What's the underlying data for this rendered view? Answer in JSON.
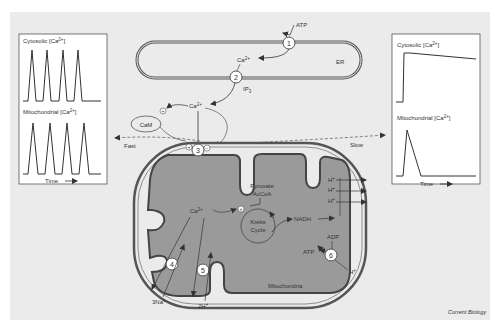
{
  "figure": {
    "credit": "Current Biology",
    "background_color": "#ebebeb",
    "matrix_color": "#9a9a9a",
    "membrane_color": "#555555"
  },
  "left_panel": {
    "top_label": "Cytosolic [Ca",
    "top_sup": "2+",
    "top_close": "]",
    "bottom_label": "Mitochondrial [Ca",
    "bottom_sup": "2+",
    "bottom_close": "]",
    "time_label": "Time",
    "cytosolic_trace": {
      "type": "oscillation",
      "spikes": 4
    },
    "mitochondrial_trace": {
      "type": "oscillation",
      "spikes": 4
    }
  },
  "right_panel": {
    "top_label": "Cytosolic [Ca",
    "top_sup": "2+",
    "top_close": "]",
    "bottom_label": "Mitochondrial [Ca",
    "bottom_sup": "2+",
    "bottom_close": "]",
    "time_label": "Time",
    "cytosolic_trace": {
      "type": "sustained-plateau"
    },
    "mitochondrial_trace": {
      "type": "single-transient"
    }
  },
  "er": {
    "label": "ER",
    "atp": "ATP",
    "ca": "Ca",
    "ca_sup": "2+",
    "ip3": "IP",
    "ip3_sub": "3"
  },
  "cytosol": {
    "ca": "Ca",
    "ca_sup": "2+",
    "cam": "CaM",
    "fast": "Fast",
    "slow": "Slow"
  },
  "mitochondria": {
    "label": "Mitochondria",
    "ca": "Ca",
    "ca_sup": "2+",
    "pyruvate": "Pyruvate",
    "acetyl_coa": "AcCoA",
    "krebs_line1": "Krebs",
    "krebs_line2": "Cycle",
    "nadh": "NADH",
    "h_plus": [
      "H",
      "H",
      "H"
    ],
    "plus_sign": "+",
    "adp": "ADP",
    "atp": "ATP",
    "h_in": "H",
    "na": "3Na",
    "h2": "2H"
  },
  "markers": {
    "plus": "+",
    "minus": "−",
    "numbers": [
      "1",
      "2",
      "3",
      "4",
      "5",
      "6"
    ]
  }
}
